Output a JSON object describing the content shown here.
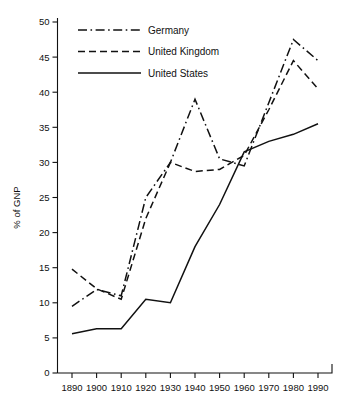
{
  "chart_data": {
    "type": "line",
    "title": "",
    "xlabel": "",
    "ylabel": "% of GNP",
    "x": [
      1890,
      1900,
      1910,
      1920,
      1930,
      1940,
      1950,
      1960,
      1970,
      1980,
      1990
    ],
    "xtick_labels": [
      "1890",
      "1900",
      "1910",
      "1920",
      "1930",
      "1940",
      "1950",
      "1960",
      "1970",
      "1980",
      "1990"
    ],
    "ytick_labels": [
      "0",
      "5",
      "10",
      "15",
      "20",
      "25",
      "30",
      "35",
      "40",
      "45",
      "50"
    ],
    "yticks": [
      0,
      5,
      10,
      15,
      20,
      25,
      30,
      35,
      40,
      45,
      50
    ],
    "xlim": [
      1885,
      1995
    ],
    "ylim": [
      0,
      50
    ],
    "grid": false,
    "legend_position": "upper left",
    "series": [
      {
        "name": "Germany",
        "style": "dash-dot",
        "color": "#111111",
        "values": [
          9.5,
          11.9,
          11.0,
          25.0,
          30.0,
          39.0,
          30.5,
          29.5,
          38.5,
          47.5,
          44.5
        ]
      },
      {
        "name": "United Kingdom",
        "style": "dashed",
        "color": "#111111",
        "values": [
          14.8,
          12.0,
          10.5,
          22.0,
          30.0,
          28.7,
          29.0,
          31.0,
          37.5,
          44.5,
          40.5
        ]
      },
      {
        "name": "United States",
        "style": "solid",
        "color": "#111111",
        "values": [
          5.6,
          6.3,
          6.3,
          10.5,
          10.0,
          18.0,
          24.0,
          31.5,
          33.0,
          34.0,
          35.5
        ]
      }
    ]
  },
  "legend": {
    "entries": [
      {
        "label": "Germany"
      },
      {
        "label": "United Kingdom"
      },
      {
        "label": "United States"
      }
    ]
  }
}
